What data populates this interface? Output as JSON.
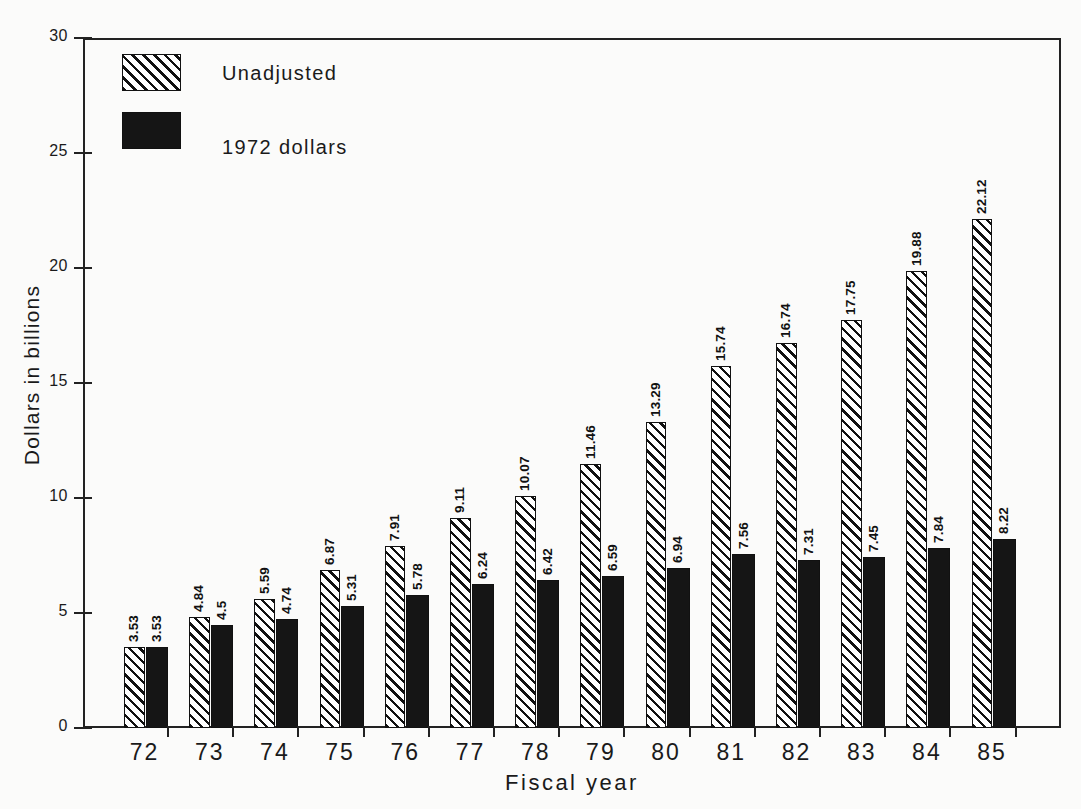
{
  "chart_data": {
    "type": "bar",
    "title": "",
    "xlabel": "Fiscal year",
    "ylabel": "Dollars in billions",
    "categories": [
      "72",
      "73",
      "74",
      "75",
      "76",
      "77",
      "78",
      "79",
      "80",
      "81",
      "82",
      "83",
      "84",
      "85"
    ],
    "series": [
      {
        "name": "Unadjusted",
        "pattern": "diagonal-hatch",
        "values": [
          3.53,
          4.84,
          5.59,
          6.87,
          7.91,
          9.11,
          10.07,
          11.46,
          13.29,
          15.74,
          16.74,
          17.75,
          19.88,
          22.12
        ],
        "labels": [
          "3.53",
          "4.84",
          "5.59",
          "6.87",
          "7.91",
          "9.11",
          "10.07",
          "11.46",
          "13.29",
          "15.74",
          "16.74",
          "17.75",
          "19.88",
          "22.12"
        ]
      },
      {
        "name": "1972 dollars",
        "pattern": "solid-black",
        "values": [
          3.53,
          4.5,
          4.74,
          5.31,
          5.78,
          6.24,
          6.42,
          6.59,
          6.94,
          7.56,
          7.31,
          7.45,
          7.84,
          8.22
        ],
        "labels": [
          "3.53",
          "4.5",
          "4.74",
          "5.31",
          "5.78",
          "6.24",
          "6.42",
          "6.59",
          "6.94",
          "7.56",
          "7.31",
          "7.45",
          "7.84",
          "8.22"
        ]
      }
    ],
    "ylim": [
      0,
      30
    ],
    "yticks": [
      0,
      5,
      10,
      15,
      20,
      25,
      30
    ],
    "ytick_labels": [
      "0",
      "5",
      "10",
      "15",
      "20",
      "25",
      "30"
    ],
    "grid": false,
    "legend_position": "top-left",
    "value_labels_rotation": 90
  },
  "legend": {
    "entries": [
      {
        "label": "Unadjusted"
      },
      {
        "label": "1972 dollars"
      }
    ]
  },
  "axes": {
    "y_title": "Dollars in billions",
    "x_title": "Fiscal year"
  },
  "colors": {
    "ink": "#111111",
    "background": "#fbfbfa",
    "bar_solid": "#151515"
  }
}
